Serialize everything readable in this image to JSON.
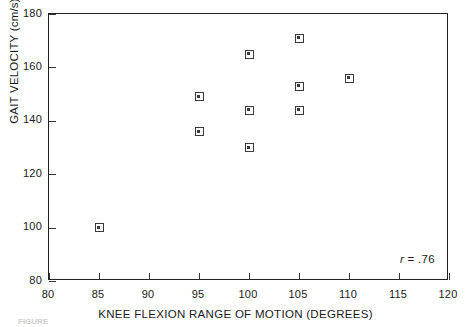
{
  "chart_data": {
    "type": "scatter",
    "title": "",
    "xlabel": "KNEE FLEXION RANGE OF MOTION (DEGREES)",
    "ylabel": "GAIT VELOCITY (cm/s)",
    "xlim": [
      80,
      120
    ],
    "ylim": [
      80,
      180
    ],
    "xticks": [
      80,
      85,
      90,
      95,
      100,
      105,
      110,
      115,
      120
    ],
    "yticks": [
      80,
      100,
      120,
      140,
      160,
      180
    ],
    "xtick_labels": [
      "80",
      "85",
      "90",
      "95",
      "100",
      "105",
      "110",
      "115",
      "120"
    ],
    "ytick_labels": [
      "80",
      "100",
      "120",
      "140",
      "160",
      "180"
    ],
    "grid": false,
    "legend": null,
    "marker": "square-with-center-dot",
    "points": [
      {
        "x": 85,
        "y": 100
      },
      {
        "x": 95,
        "y": 149
      },
      {
        "x": 95,
        "y": 136
      },
      {
        "x": 100,
        "y": 165
      },
      {
        "x": 100,
        "y": 144
      },
      {
        "x": 100,
        "y": 130
      },
      {
        "x": 105,
        "y": 171
      },
      {
        "x": 105,
        "y": 153
      },
      {
        "x": 105,
        "y": 144
      },
      {
        "x": 110,
        "y": 156
      }
    ],
    "annotations": [
      {
        "name": "correlation",
        "symbol": "r",
        "text": "= .76",
        "full": "r = .76",
        "position": "bottom-right-inside-axes"
      }
    ]
  },
  "caption": {
    "label": "FIGURE",
    "text": "(caption text cropped at image edge)"
  },
  "colors": {
    "axis": "#222222",
    "marker_edge": "#3a3a3a",
    "marker_face": "#ffffff",
    "text": "#1a1a1a",
    "background": "#ffffff"
  }
}
